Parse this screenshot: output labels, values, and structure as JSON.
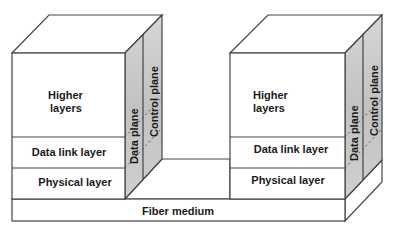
{
  "diagram": {
    "type": "layered protocol stack, two nodes connected by fiber",
    "colors": {
      "line": "#444444",
      "side_plane_fill": "#c8c8c8",
      "background": "#ffffff"
    },
    "left_node": {
      "layers": {
        "higher_1": "Higher",
        "higher_2": "layers",
        "data_link": "Data link layer",
        "physical": "Physical layer"
      },
      "planes": {
        "data": "Data plane",
        "control": "Control plane"
      }
    },
    "right_node": {
      "layers": {
        "higher_1": "Higher",
        "higher_2": "layers",
        "data_link": "Data link layer",
        "physical": "Physical layer"
      },
      "planes": {
        "data": "Data plane",
        "control": "Control plane"
      }
    },
    "medium": {
      "label": "Fiber medium"
    }
  }
}
